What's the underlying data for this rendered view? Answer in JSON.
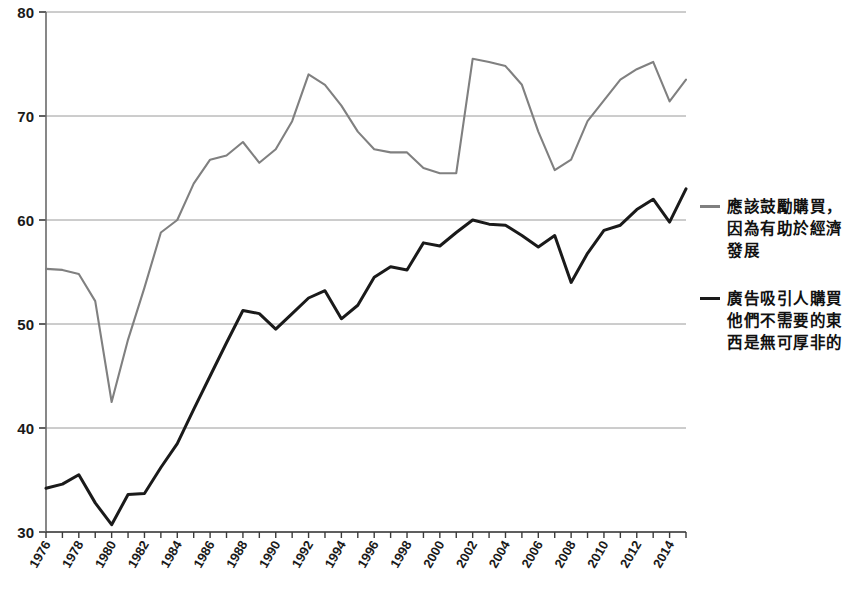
{
  "chart_data": {
    "type": "line",
    "title": "",
    "xlabel": "",
    "ylabel": "",
    "xlim": [
      1976,
      2015
    ],
    "ylim": [
      30,
      80
    ],
    "yticks": [
      30,
      40,
      50,
      60,
      70,
      80
    ],
    "grid": true,
    "legend_position": "right",
    "xtick_labels": [
      "1976",
      "1978",
      "1980",
      "1982",
      "1984",
      "1986",
      "1988",
      "1990",
      "1992",
      "1994",
      "1996",
      "1998",
      "2000",
      "2002",
      "2004",
      "2006",
      "2008",
      "2010",
      "2012",
      "2014"
    ],
    "x": [
      1976,
      1977,
      1978,
      1979,
      1980,
      1981,
      1982,
      1983,
      1984,
      1985,
      1986,
      1987,
      1988,
      1989,
      1990,
      1991,
      1992,
      1993,
      1994,
      1995,
      1996,
      1997,
      1998,
      1999,
      2000,
      2001,
      2002,
      2003,
      2004,
      2005,
      2006,
      2007,
      2008,
      2009,
      2010,
      2011,
      2012,
      2013,
      2014,
      2015
    ],
    "series": [
      {
        "name": "應該鼓勵購買，因為有助於經濟發展",
        "color": "#808080",
        "values": [
          55.3,
          55.2,
          54.8,
          52.2,
          42.5,
          48.5,
          53.5,
          58.8,
          60.0,
          63.5,
          65.8,
          66.2,
          67.5,
          65.5,
          66.8,
          69.5,
          74.0,
          73.0,
          71.0,
          68.5,
          66.8,
          66.5,
          66.5,
          65.0,
          64.5,
          64.5,
          75.5,
          75.2,
          74.8,
          73.0,
          68.5,
          64.8,
          65.8,
          69.5,
          71.5,
          73.5,
          74.5,
          75.2,
          71.4,
          73.5
        ]
      },
      {
        "name": "廣告吸引人購買他們不需要的東西是無可厚非的",
        "color": "#1a1a1a",
        "values": [
          34.2,
          34.6,
          35.5,
          32.8,
          30.7,
          33.6,
          33.7,
          36.2,
          38.5,
          41.8,
          45.0,
          48.2,
          51.3,
          51.0,
          49.5,
          51.0,
          52.5,
          53.2,
          50.5,
          51.8,
          54.5,
          55.5,
          55.2,
          57.8,
          57.5,
          58.8,
          60.0,
          59.6,
          59.5,
          58.5,
          57.4,
          58.5,
          54.0,
          56.8,
          59.0,
          59.5,
          61.0,
          62.0,
          59.8,
          63.0
        ]
      }
    ]
  },
  "caption": {
    "text": ""
  }
}
